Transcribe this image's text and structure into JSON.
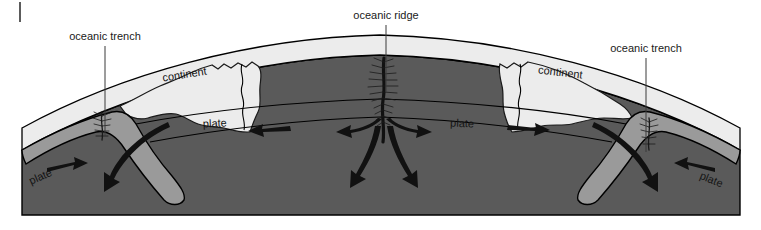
{
  "figure": {
    "background_color": "#ffffff"
  },
  "colors": {
    "crust_light": "#e9e9e9",
    "lithosphere_mid": "#a8a8a8",
    "mantle_dark": "#5a5a5a",
    "slab_fill": "#9a9a9a",
    "outline": "#000000",
    "label_text": "#1a1a1a",
    "leader_line": "#3a3a3a"
  },
  "callouts": [
    {
      "id": "oceanic-trench-left",
      "label": "oceanic trench",
      "text_x": 105,
      "text_y": 40,
      "leader_x": 105,
      "leader_y1": 46,
      "leader_y2": 136
    },
    {
      "id": "oceanic-ridge",
      "label": "oceanic ridge",
      "text_x": 386,
      "text_y": 19,
      "leader_x": 386,
      "leader_y1": 25,
      "leader_y2": 92
    },
    {
      "id": "oceanic-trench-right",
      "label": "oceanic trench",
      "text_x": 646,
      "text_y": 52,
      "leader_x": 646,
      "leader_y1": 58,
      "leader_y2": 152
    }
  ],
  "inline_labels": [
    {
      "id": "plate-far-left",
      "label": "plate",
      "x": 42,
      "y": 180,
      "rotate": -24
    },
    {
      "id": "continent-left",
      "label": "continent",
      "x": 185,
      "y": 78,
      "rotate": -9
    },
    {
      "id": "plate-inner-left",
      "label": "plate",
      "x": 215,
      "y": 127,
      "rotate": -3
    },
    {
      "id": "plate-inner-right",
      "label": "plate",
      "x": 462,
      "y": 127,
      "rotate": 2
    },
    {
      "id": "continent-right",
      "label": "continent",
      "x": 560,
      "y": 76,
      "rotate": 7
    },
    {
      "id": "plate-far-right",
      "label": "plate",
      "x": 710,
      "y": 183,
      "rotate": 22
    }
  ],
  "motion_arrows": [
    {
      "id": "arrow-left-convergent",
      "direction": "right",
      "meaning": "oceanic plate moves toward trench"
    },
    {
      "id": "arrow-left-slab",
      "direction": "down-left",
      "meaning": "subducting slab descends"
    },
    {
      "id": "arrow-left-continent",
      "direction": "left",
      "meaning": "continental plate moves left"
    },
    {
      "id": "arrow-ridge-spread-left",
      "direction": "left",
      "meaning": "sea-floor spreading to the left"
    },
    {
      "id": "arrow-ridge-spread-right",
      "direction": "right",
      "meaning": "sea-floor spreading to the right"
    },
    {
      "id": "arrow-ridge-upwelling",
      "direction": "up",
      "meaning": "mantle upwelling beneath ridge"
    },
    {
      "id": "arrow-right-continent",
      "direction": "right",
      "meaning": "continental plate moves right"
    },
    {
      "id": "arrow-right-slab",
      "direction": "down-right",
      "meaning": "subducting slab descends"
    },
    {
      "id": "arrow-right-convergent",
      "direction": "left",
      "meaning": "oceanic plate moves toward trench"
    }
  ],
  "corner_tick": {
    "id": "crop-tick-mark",
    "x": 20,
    "y_top": 2,
    "y_bottom": 22
  }
}
